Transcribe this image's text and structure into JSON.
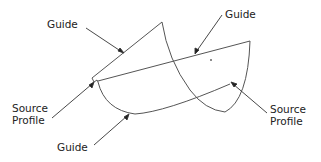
{
  "labels": {
    "guide_top_left": "Guide",
    "guide_top_right": "Guide",
    "source_profile_left_1": "Source",
    "source_profile_left_2": "Profile",
    "source_profile_right_1": "Source",
    "source_profile_right_2": "Profile",
    "guide_bottom": "Guide"
  },
  "colors": {
    "stroke": "#555555",
    "text": "#222222"
  }
}
